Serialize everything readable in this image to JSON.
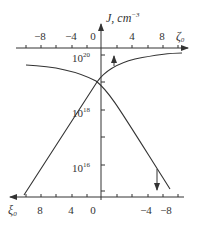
{
  "figure": {
    "y_axis": {
      "label": "J, cm",
      "label_exp": "−3",
      "ticks": [
        {
          "base": "10",
          "exp": "20",
          "y": 55
        },
        {
          "base": "10",
          "exp": "18",
          "y": 110
        },
        {
          "base": "10",
          "exp": "16",
          "y": 165
        }
      ]
    },
    "top_axis": {
      "variable": "ζ",
      "subscript": "0",
      "tick_labels": [
        {
          "text": "−8",
          "x": 40
        },
        {
          "text": "−4",
          "x": 71
        },
        {
          "text": "0",
          "x": 93
        },
        {
          "text": "4",
          "x": 132
        },
        {
          "text": "8",
          "x": 162
        }
      ]
    },
    "bottom_axis": {
      "variable": "ξ",
      "subscript": "0",
      "tick_labels": [
        {
          "text": "8",
          "x": 40
        },
        {
          "text": "4",
          "x": 71
        },
        {
          "text": "0",
          "x": 93
        },
        {
          "text": "−4",
          "x": 146
        },
        {
          "text": "−8",
          "x": 164
        }
      ]
    },
    "curves": [
      {
        "name": "J vs zeta0",
        "direction_arrow": "up"
      },
      {
        "name": "J vs xi0",
        "direction_arrow": "down"
      }
    ],
    "colors": {
      "line": "#333333"
    }
  }
}
